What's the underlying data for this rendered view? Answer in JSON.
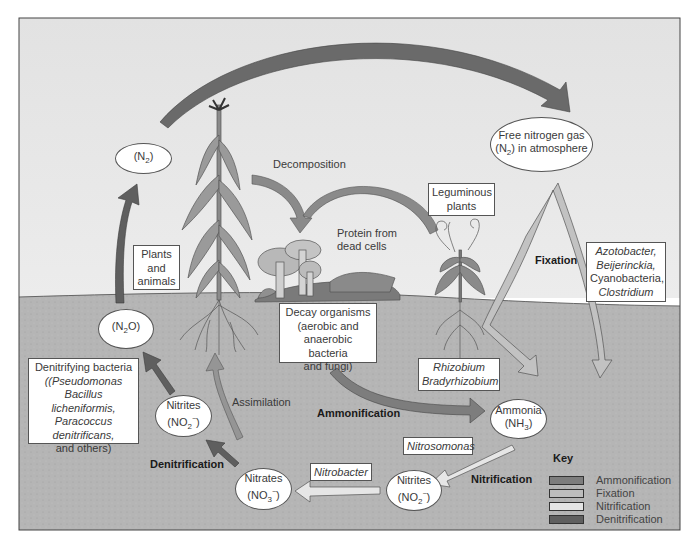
{
  "diagram": {
    "colors": {
      "sky": "#e6e6e6",
      "soil": "#b4b4b4",
      "ammonification": "#7d7d7d",
      "fixation": "#bdbdbd",
      "nitrification": "#e4e4e4",
      "denitrification": "#5f5f5f",
      "frame": "#444444"
    },
    "nodes": {
      "n2": {
        "prefix": "(N",
        "sub": "2",
        "suffix": ")"
      },
      "free_n2": {
        "line1": "Free nitrogen gas",
        "line2_prefix": "(N",
        "line2_sub": "2",
        "line2_suffix": ") in atmosphere"
      },
      "n2o": {
        "prefix": "(N",
        "sub": "2",
        "suffix": "O)"
      },
      "nitrites_left": {
        "line1": "Nitrites",
        "line2_prefix": "(NO",
        "line2_sub": "2",
        "line2_sup": "−",
        "line2_suffix": ")"
      },
      "nitrates": {
        "line1": "Nitrates",
        "line2_prefix": "(NO",
        "line2_sub": "3",
        "line2_sup": "−",
        "line2_suffix": ")"
      },
      "nitrites_right": {
        "line1": "Nitrites",
        "line2_prefix": "(NO",
        "line2_sub": "2",
        "line2_sup": "−",
        "line2_suffix": ")"
      },
      "ammonia": {
        "line1": "Ammonia",
        "line2_prefix": "(NH",
        "line2_sub": "3",
        "line2_suffix": ")"
      }
    },
    "boxes": {
      "plants_animals": [
        "Plants",
        "and",
        "animals"
      ],
      "leguminous": [
        "Leguminous",
        "plants"
      ],
      "fixers": [
        "Azotobacter,",
        "Beijerinckia,",
        "Cyanobacteria,",
        "Clostridium"
      ],
      "decay": [
        "Decay organisms",
        "(aerobic and",
        "anaerobic bacteria",
        "and fungi)"
      ],
      "rhizobium": [
        "Rhizobium",
        "Bradyrhizobium"
      ],
      "denitrifying": [
        "Denitrifying bacteria",
        "(Pseudomonas",
        "Bacillus licheniformis,",
        "Paracoccus",
        "denitrificans,",
        "and others)"
      ],
      "nitrosomonas": "Nitrosomonas",
      "nitrobacter": "Nitrobacter"
    },
    "labels": {
      "decomposition": "Decomposition",
      "protein": [
        "Protein from",
        "dead cells"
      ],
      "fixation": "Fixation",
      "assimilation": "Assimilation",
      "ammonification": "Ammonification",
      "denitrification": "Denitrification",
      "nitrification": "Nitrification"
    },
    "key": {
      "title": "Key",
      "items": [
        {
          "label": "Ammonification",
          "color": "#7d7d7d"
        },
        {
          "label": "Fixation",
          "color": "#bdbdbd"
        },
        {
          "label": "Nitrification",
          "color": "#e4e4e4"
        },
        {
          "label": "Denitrification",
          "color": "#5f5f5f"
        }
      ]
    }
  }
}
